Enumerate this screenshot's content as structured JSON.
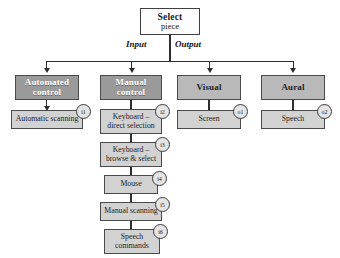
{
  "diagram": {
    "root": {
      "title": "Select",
      "subtitle": "piece"
    },
    "branch_labels": {
      "input": "Input",
      "output": "Output"
    },
    "columns": [
      {
        "id": "automated-control",
        "side": "input",
        "header_line1": "Automated",
        "header_line2": "control",
        "nodes": [
          {
            "badge": "i1",
            "line1": "Automatic scanning",
            "line2": ""
          }
        ]
      },
      {
        "id": "manual-control",
        "side": "input",
        "header_line1": "Manual",
        "header_line2": "control",
        "nodes": [
          {
            "badge": "i2",
            "line1": "Keyboard –",
            "line2": "direct selection"
          },
          {
            "badge": "i3",
            "line1": "Keyboard –",
            "line2": "browse & select"
          },
          {
            "badge": "i4",
            "line1": "Mouse",
            "line2": ""
          },
          {
            "badge": "i5",
            "line1": "Manual scanning",
            "line2": ""
          },
          {
            "badge": "i6",
            "line1": "Speech",
            "line2": "commands"
          }
        ]
      },
      {
        "id": "visual",
        "side": "output",
        "header_line1": "Visual",
        "header_line2": "",
        "nodes": [
          {
            "badge": "o1",
            "line1": "Screen",
            "line2": ""
          }
        ]
      },
      {
        "id": "aural",
        "side": "output",
        "header_line1": "Aural",
        "header_line2": "",
        "nodes": [
          {
            "badge": "o2",
            "line1": "Speech",
            "line2": ""
          }
        ]
      }
    ],
    "colors": {
      "header_input_fill": "#9a9a9a",
      "header_output_fill": "#b9b9b9",
      "leaf_fill": "#d2d2d2",
      "root_fill": "#fdfdfd",
      "badge_fill": "#e4e4e4",
      "line": "#2e2e2e",
      "border": "#4a4a4a",
      "background": "#ffffff"
    }
  }
}
